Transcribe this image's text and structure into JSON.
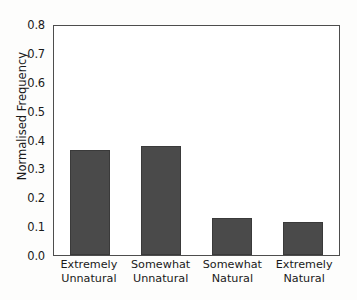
{
  "chart_data": {
    "type": "bar",
    "title": "",
    "xlabel": "",
    "ylabel": "Normalised Frequency",
    "categories": [
      "Extremely Unnatural",
      "Somewhat Unnatural",
      "Somewhat Natural",
      "Extremely Natural"
    ],
    "category_lines": [
      [
        "Extremely",
        "Unnatural"
      ],
      [
        "Somewhat",
        "Unnatural"
      ],
      [
        "Somewhat",
        "Natural"
      ],
      [
        "Extremely",
        "Natural"
      ]
    ],
    "values": [
      0.363,
      0.378,
      0.128,
      0.115
    ],
    "ylim": [
      0.0,
      0.8
    ],
    "xlim": [
      0,
      4
    ],
    "yticks": [
      0.0,
      0.1,
      0.2,
      0.3,
      0.4,
      0.5,
      0.6,
      0.7,
      0.8
    ],
    "ytick_labels": [
      "0.0",
      "0.1",
      "0.2",
      "0.3",
      "0.4",
      "0.5",
      "0.6",
      "0.7",
      "0.8"
    ],
    "grid": false,
    "legend": null,
    "bar_color": "#4a4a4a",
    "axis_color": "#4d4d4d",
    "background_color": "#ffffff"
  }
}
